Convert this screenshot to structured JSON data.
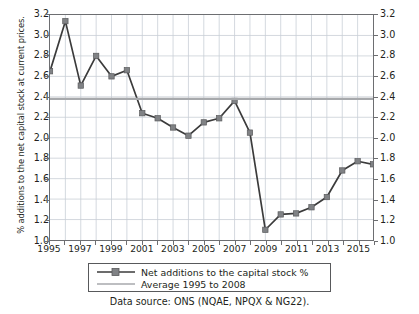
{
  "chart_data": {
    "type": "line",
    "title": "",
    "xlabel": "",
    "ylabel": "% additions to the net capital stock at current prices.",
    "xlim": [
      1995,
      2016
    ],
    "ylim": [
      1.0,
      3.2
    ],
    "grid": true,
    "legend_position": "below-axes",
    "x": [
      1995,
      1996,
      1997,
      1998,
      1999,
      2000,
      2001,
      2002,
      2003,
      2004,
      2005,
      2006,
      2007,
      2008,
      2009,
      2010,
      2011,
      2012,
      2013,
      2014,
      2015,
      2016
    ],
    "xtick_labels": [
      "1995",
      "1997",
      "1999",
      "2001",
      "2003",
      "2005",
      "2007",
      "2009",
      "2011",
      "2013",
      "2015"
    ],
    "xtick_values": [
      1995,
      1997,
      1999,
      2001,
      2003,
      2005,
      2007,
      2009,
      2011,
      2013,
      2015
    ],
    "ytick_labels": [
      "1.0",
      "1.2",
      "1.4",
      "1.6",
      "1.8",
      "2.0",
      "2.2",
      "2.4",
      "2.6",
      "2.8",
      "3.0",
      "3.2"
    ],
    "ytick_values": [
      1.0,
      1.2,
      1.4,
      1.6,
      1.8,
      2.0,
      2.2,
      2.4,
      2.6,
      2.8,
      3.0,
      3.2
    ],
    "right_axis_ytick_labels": [
      "1.0",
      "1.2",
      "1.4",
      "1.6",
      "1.8",
      "2.0",
      "2.2",
      "2.4",
      "2.6",
      "2.8",
      "3.0",
      "3.2"
    ],
    "series": [
      {
        "name": "Net additions to the capital stock %",
        "type": "line-markers",
        "color": "#3b3b3b",
        "marker_color": "#808285",
        "marker": "square",
        "values": [
          2.65,
          3.14,
          2.51,
          2.8,
          2.6,
          2.66,
          2.24,
          2.19,
          2.1,
          2.02,
          2.15,
          2.19,
          2.36,
          2.05,
          1.1,
          1.25,
          1.26,
          1.32,
          1.42,
          1.68,
          1.77,
          1.74
        ]
      },
      {
        "name": "Average 1995 to 2008",
        "type": "hline",
        "color": "#a7a9ac",
        "value": 2.38
      }
    ]
  },
  "legend": {
    "items": [
      {
        "label": "Net additions to the capital stock %",
        "key": "line-marker-key"
      },
      {
        "label": "Average 1995 to 2008",
        "key": "line-key"
      }
    ]
  },
  "source_note": "Data source: ONS (NQAE, NPQX & NG22).",
  "colors": {
    "series_line": "#3b3b3b",
    "series_marker": "#808285",
    "average_line": "#a7a9ac",
    "grid": "#c9cfd6",
    "axis": "#6d6e71",
    "text": "#231f20"
  }
}
